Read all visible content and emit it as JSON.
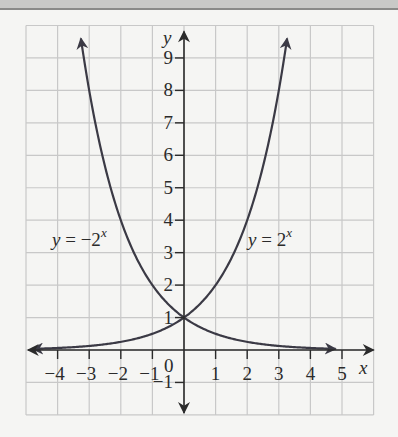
{
  "chart_data": {
    "type": "line",
    "title": "",
    "xlabel": "x",
    "ylabel": "y",
    "xlim": [
      -5,
      6
    ],
    "ylim": [
      -2,
      10
    ],
    "grid": true,
    "legend": "inline labels",
    "x_ticks": [
      -4,
      -3,
      -2,
      -1,
      1,
      2,
      3,
      4,
      5
    ],
    "x_tick_labels": [
      "−4",
      "−3",
      "−2",
      "−1",
      "1",
      "2",
      "3",
      "4",
      "5"
    ],
    "y_ticks": [
      -1,
      1,
      2,
      3,
      4,
      5,
      6,
      7,
      8,
      9
    ],
    "y_tick_labels": [
      "−1",
      "1",
      "2",
      "3",
      "4",
      "5",
      "6",
      "7",
      "8",
      "9"
    ],
    "origin_label": "0",
    "series": [
      {
        "name": "y = 2^x",
        "label_text": "y = 2",
        "label_exp": "x",
        "x": [
          -5,
          -4,
          -3,
          -2,
          -1,
          0,
          1,
          2,
          3,
          3.25
        ],
        "values": [
          0.03,
          0.06,
          0.125,
          0.25,
          0.5,
          1,
          2,
          4,
          8,
          9.5
        ]
      },
      {
        "name": "y = −2^x",
        "label_text": "y = −2",
        "label_exp": "x",
        "x": [
          -3.25,
          -3,
          -2,
          -1,
          0,
          1,
          2,
          3,
          4,
          4.8
        ],
        "values": [
          9.5,
          8,
          4,
          2,
          1,
          0.5,
          0.25,
          0.125,
          0.06,
          0.04
        ]
      }
    ],
    "colors": {
      "curve": "#3b3a45",
      "axis": "#2b2b2b",
      "grid": "#c8c8c8",
      "background": "#f5f5f3"
    }
  }
}
